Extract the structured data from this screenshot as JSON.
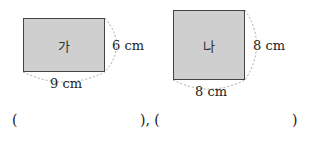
{
  "figures": [
    {
      "label": "가",
      "width_label": "9 cm",
      "height_label": "6 cm"
    },
    {
      "label": "나",
      "width_label": "8 cm",
      "height_label": "8 cm"
    }
  ],
  "answer_line": {
    "open1": "(",
    "close1_sep": "), (",
    "close2": ")"
  }
}
